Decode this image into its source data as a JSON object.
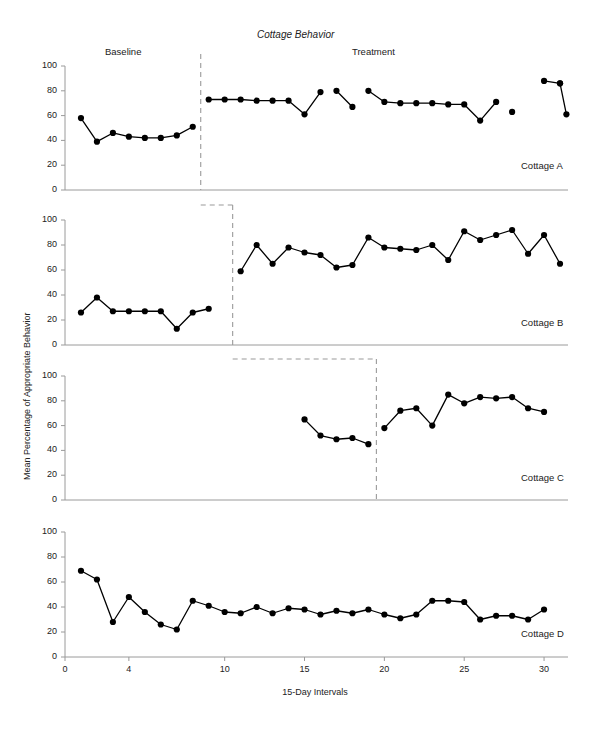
{
  "chart_data": {
    "type": "line",
    "title": "Cottage Behavior",
    "xlabel": "15-Day Intervals",
    "ylabel": "Mean Percentage of Appropriate Behavior",
    "design": "multiple-baseline across settings",
    "phase_labels": [
      "Baseline",
      "Treatment"
    ],
    "xlim": [
      0,
      31.5
    ],
    "ylim": [
      0,
      100
    ],
    "xticks": [
      0,
      4,
      10,
      15,
      20,
      25,
      30
    ],
    "yticks": [
      0,
      20,
      40,
      60,
      80,
      100
    ],
    "grid": false,
    "legend": "none",
    "marker": "filled-circle",
    "line_color": "#000000",
    "phase_line_color": "#9a9a9a",
    "axis_color": "#9a9a9a",
    "panels": [
      {
        "name": "Cottage A",
        "label": "Cottage A",
        "phase_change_x": 8.5,
        "segments": [
          {
            "phase": "Baseline",
            "x": [
              1,
              2,
              3,
              4,
              5,
              6,
              7,
              8
            ],
            "y": [
              58,
              39,
              46,
              43,
              42,
              42,
              44,
              51
            ]
          },
          {
            "phase": "Treatment",
            "x": [
              9,
              10,
              11,
              12,
              13,
              14,
              15,
              16
            ],
            "y": [
              73,
              73,
              73,
              72,
              72,
              72,
              61,
              79
            ]
          },
          {
            "phase": "Treatment",
            "x": [
              17,
              18
            ],
            "y": [
              80,
              67
            ]
          },
          {
            "phase": "Treatment",
            "x": [
              19,
              20,
              21,
              22,
              23,
              24,
              25,
              26,
              27
            ],
            "y": [
              80,
              71,
              70,
              70,
              70,
              69,
              69,
              56,
              71
            ]
          },
          {
            "phase": "Treatment",
            "x": [
              28
            ],
            "y": [
              63
            ]
          },
          {
            "phase": "Treatment",
            "x": [
              30,
              31
            ],
            "y": [
              88,
              86
            ]
          },
          {
            "phase": "Treatment",
            "x": [
              31,
              31.4
            ],
            "y": [
              86,
              61
            ]
          }
        ]
      },
      {
        "name": "Cottage B",
        "label": "Cottage B",
        "phase_change_x": 10.5,
        "segments": [
          {
            "phase": "Baseline",
            "x": [
              1,
              2,
              3,
              4,
              5,
              6,
              7,
              8,
              9
            ],
            "y": [
              26,
              38,
              27,
              27,
              27,
              27,
              13,
              26,
              29
            ]
          },
          {
            "phase": "Treatment",
            "x": [
              11,
              12,
              13,
              14,
              15,
              16,
              17,
              18,
              19,
              20,
              21,
              22,
              23,
              24,
              25,
              26,
              27,
              28,
              29,
              30,
              31
            ],
            "y": [
              59,
              80,
              65,
              78,
              74,
              72,
              62,
              64,
              86,
              78,
              77,
              76,
              80,
              68,
              91,
              84,
              88,
              92,
              73,
              88,
              65
            ]
          }
        ]
      },
      {
        "name": "Cottage C",
        "label": "Cottage C",
        "phase_change_x": 19.5,
        "segments": [
          {
            "phase": "Baseline",
            "x": [
              15,
              16,
              17,
              18,
              19
            ],
            "y": [
              65,
              52,
              49,
              50,
              45
            ]
          },
          {
            "phase": "Treatment",
            "x": [
              20,
              21,
              22,
              23,
              24,
              25,
              26,
              27,
              28,
              29,
              30
            ],
            "y": [
              58,
              72,
              74,
              60,
              85,
              78,
              83,
              82,
              83,
              74,
              71,
              82
            ]
          }
        ]
      },
      {
        "name": "Cottage D",
        "label": "Cottage D",
        "phase_change_x": null,
        "segments": [
          {
            "phase": "Baseline",
            "x": [
              1,
              2,
              3,
              4,
              5,
              6,
              7,
              8,
              9,
              10,
              11,
              12,
              13,
              14,
              15,
              16,
              17,
              18,
              19,
              20,
              21,
              22,
              23,
              24,
              25,
              26,
              27,
              28,
              29,
              30
            ],
            "y": [
              69,
              62,
              28,
              48,
              36,
              26,
              22,
              45,
              41,
              36,
              35,
              40,
              35,
              39,
              38,
              34,
              37,
              35,
              38,
              34,
              31,
              34,
              45,
              45,
              44,
              30,
              33,
              33,
              30,
              38,
              42,
              51
            ]
          }
        ]
      }
    ]
  }
}
